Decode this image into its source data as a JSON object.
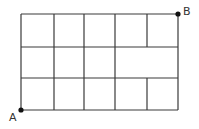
{
  "diagram": {
    "type": "grid-path",
    "grid": {
      "columns": 5,
      "rows": 3,
      "x_lines": [
        21,
        54,
        84,
        115,
        147,
        178
      ],
      "y_lines": [
        14,
        47,
        78,
        110
      ],
      "missing_segments": [
        {
          "orientation": "vertical",
          "x": 147,
          "y1": 47,
          "y2": 78
        }
      ],
      "line_color": "#3a3a3a"
    },
    "points": [
      {
        "label": "A",
        "x": 21,
        "y": 110,
        "label_x": 9,
        "label_y": 112
      },
      {
        "label": "B",
        "x": 178,
        "y": 14,
        "label_x": 183,
        "label_y": 6
      }
    ]
  }
}
